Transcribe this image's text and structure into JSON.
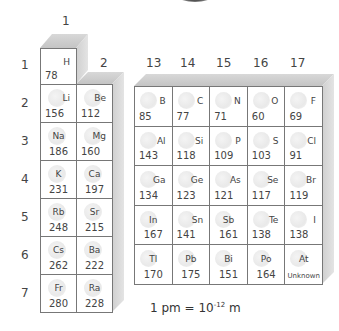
{
  "group_labels": {
    "g1": "1",
    "g2": "2",
    "g13": "13",
    "g14": "14",
    "g15": "15",
    "g16": "16",
    "g17": "17"
  },
  "period_labels": [
    "1",
    "2",
    "3",
    "4",
    "5",
    "6",
    "7"
  ],
  "left_block": [
    {
      "symbol": "H",
      "radius": "78",
      "period": 1,
      "col": 0
    },
    {
      "symbol": "Li",
      "radius": "156",
      "period": 2,
      "col": 0
    },
    {
      "symbol": "Be",
      "radius": "112",
      "period": 2,
      "col": 1
    },
    {
      "symbol": "Na",
      "radius": "186",
      "period": 3,
      "col": 0
    },
    {
      "symbol": "Mg",
      "radius": "160",
      "period": 3,
      "col": 1
    },
    {
      "symbol": "K",
      "radius": "231",
      "period": 4,
      "col": 0
    },
    {
      "symbol": "Ca",
      "radius": "197",
      "period": 4,
      "col": 1
    },
    {
      "symbol": "Rb",
      "radius": "248",
      "period": 5,
      "col": 0
    },
    {
      "symbol": "Sr",
      "radius": "215",
      "period": 5,
      "col": 1
    },
    {
      "symbol": "Cs",
      "radius": "262",
      "period": 6,
      "col": 0
    },
    {
      "symbol": "Ba",
      "radius": "222",
      "period": 6,
      "col": 1
    },
    {
      "symbol": "Fr",
      "radius": "280",
      "period": 7,
      "col": 0
    },
    {
      "symbol": "Ra",
      "radius": "228",
      "period": 7,
      "col": 1
    }
  ],
  "right_block": [
    [
      {
        "symbol": "B",
        "radius": "85"
      },
      {
        "symbol": "C",
        "radius": "77"
      },
      {
        "symbol": "N",
        "radius": "71"
      },
      {
        "symbol": "O",
        "radius": "60"
      },
      {
        "symbol": "F",
        "radius": "69"
      }
    ],
    [
      {
        "symbol": "Al",
        "radius": "143"
      },
      {
        "symbol": "Si",
        "radius": "118"
      },
      {
        "symbol": "P",
        "radius": "109"
      },
      {
        "symbol": "S",
        "radius": "103"
      },
      {
        "symbol": "Cl",
        "radius": "91"
      }
    ],
    [
      {
        "symbol": "Ga",
        "radius": "134"
      },
      {
        "symbol": "Ge",
        "radius": "123"
      },
      {
        "symbol": "As",
        "radius": "121"
      },
      {
        "symbol": "Se",
        "radius": "117"
      },
      {
        "symbol": "Br",
        "radius": "119"
      }
    ],
    [
      {
        "symbol": "In",
        "radius": "167"
      },
      {
        "symbol": "Sn",
        "radius": "141"
      },
      {
        "symbol": "Sb",
        "radius": "161"
      },
      {
        "symbol": "Te",
        "radius": "138"
      },
      {
        "symbol": "I",
        "radius": "138"
      }
    ],
    [
      {
        "symbol": "Tl",
        "radius": "170"
      },
      {
        "symbol": "Pb",
        "radius": "175"
      },
      {
        "symbol": "Bi",
        "radius": "151"
      },
      {
        "symbol": "Po",
        "radius": "164"
      },
      {
        "symbol": "At",
        "radius": "Unknown"
      }
    ]
  ],
  "unit_note": {
    "prefix": "1 pm = 10",
    "exponent": "-12",
    "suffix": " m"
  },
  "colors": {
    "border": "#777777",
    "face_top": "#c8c8c8",
    "face_side": "#d8d8d8",
    "text": "#444444"
  }
}
